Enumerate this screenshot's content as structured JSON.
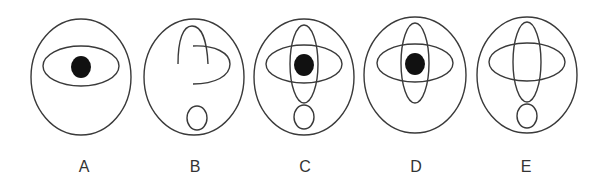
{
  "figure": {
    "stroke_color": "#3a3a3a",
    "fill_color": "#111111",
    "options": [
      {
        "label": "A",
        "cx": 81,
        "cy": 77,
        "has_horizontal_ellipse": true,
        "has_vertical_ellipse": false,
        "has_dot": true,
        "has_bottom_oval": false,
        "label_x": 84
      },
      {
        "label": "B",
        "cx": 194,
        "cy": 77,
        "has_horizontal_ellipse": false,
        "has_vertical_ellipse": false,
        "has_dot": false,
        "has_bottom_oval": true,
        "partial_strokes": true,
        "label_x": 195
      },
      {
        "label": "C",
        "cx": 304,
        "cy": 77,
        "has_horizontal_ellipse": true,
        "has_vertical_ellipse": true,
        "has_dot": true,
        "has_bottom_oval": true,
        "label_x": 305
      },
      {
        "label": "D",
        "cx": 415,
        "cy": 75,
        "has_horizontal_ellipse": true,
        "has_vertical_ellipse": true,
        "has_dot": true,
        "has_bottom_oval": false,
        "label_x": 416
      },
      {
        "label": "E",
        "cx": 527,
        "cy": 75,
        "has_horizontal_ellipse": true,
        "has_vertical_ellipse": true,
        "has_dot": false,
        "has_bottom_oval": true,
        "label_x": 526
      }
    ]
  }
}
